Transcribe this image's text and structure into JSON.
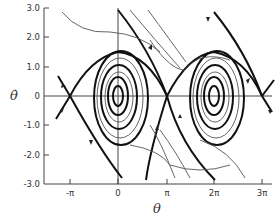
{
  "figure": {
    "type": "phase-portrait",
    "y_axis": {
      "label": "θ̇",
      "ticks": [
        "3.0",
        "2.0",
        "1.0",
        "0",
        "-1.0",
        "-2.0",
        "-3.0"
      ]
    },
    "x_axis": {
      "label": "θ",
      "ticks": [
        "-π",
        "0",
        "π",
        "2π",
        "3π"
      ]
    },
    "features": {
      "stable_foci": [
        "0",
        "2π"
      ],
      "saddle_points": [
        "-π",
        "π",
        "3π"
      ]
    }
  }
}
